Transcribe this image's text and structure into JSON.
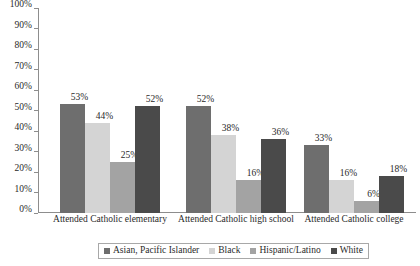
{
  "chart_data": {
    "type": "bar",
    "title": "",
    "subtitle": "",
    "xlabel": "",
    "ylabel": "",
    "ylim": [
      0,
      100
    ],
    "y_tick_labels": [
      "0%",
      "10%",
      "20%",
      "30%",
      "40%",
      "50%",
      "60%",
      "70%",
      "80%",
      "90%",
      "100%"
    ],
    "y_tick_values": [
      0,
      10,
      20,
      30,
      40,
      50,
      60,
      70,
      80,
      90,
      100
    ],
    "grid": false,
    "legend_position": "bottom",
    "value_suffix": "%",
    "categories": [
      "Attended Catholic elementary",
      "Attended Catholic high school",
      "Attended Catholic college"
    ],
    "series": [
      {
        "name": "Asian, Pacific Islander",
        "color": "#6e6e6e",
        "values": [
          53,
          52,
          33
        ],
        "labels": [
          "53%",
          "52%",
          "33%"
        ]
      },
      {
        "name": "Black",
        "color": "#d4d4d4",
        "values": [
          44,
          38,
          16
        ],
        "labels": [
          "44%",
          "38%",
          "16%"
        ]
      },
      {
        "name": "Hispanic/Latino",
        "color": "#a3a3a3",
        "values": [
          25,
          16,
          6
        ],
        "labels": [
          "25%",
          "16%",
          "6%"
        ]
      },
      {
        "name": "White",
        "color": "#4a4a4a",
        "values": [
          52,
          36,
          18
        ],
        "labels": [
          "52%",
          "36%",
          "18%"
        ]
      }
    ]
  }
}
